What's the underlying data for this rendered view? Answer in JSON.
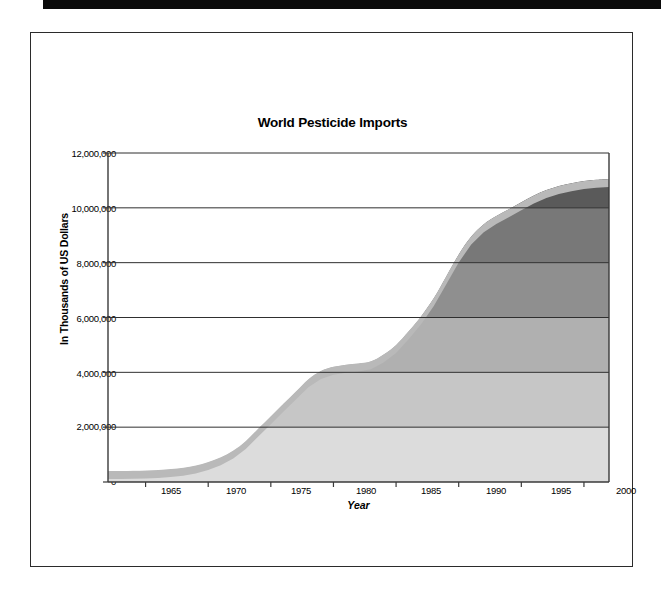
{
  "page": {
    "top_bar_name": "black-header-band",
    "frame_name": "document-page-frame"
  },
  "chart_data": {
    "type": "area",
    "title": "World Pesticide Imports",
    "xlabel": "Year",
    "ylabel": "In Thousands of US Dollars",
    "xlim": [
      1962,
      2002
    ],
    "ylim": [
      0,
      12000000
    ],
    "grid": true,
    "legend": "none",
    "ytick_labels": [
      "12,000,000",
      "10,000,000",
      "8,000,000",
      "6,000,000",
      "4,000,000",
      "2,000,000",
      "0"
    ],
    "ytick_values": [
      12000000,
      10000000,
      8000000,
      6000000,
      4000000,
      2000000,
      0
    ],
    "xtick_labels": [
      "1965",
      "1970",
      "1975",
      "1980",
      "1985",
      "1990",
      "1995",
      "2000"
    ],
    "xtick_values": [
      1965,
      1970,
      1975,
      1980,
      1985,
      1990,
      1995,
      2000
    ],
    "x": [
      1962,
      1963,
      1964,
      1965,
      1966,
      1967,
      1968,
      1969,
      1970,
      1971,
      1972,
      1973,
      1974,
      1975,
      1976,
      1977,
      1978,
      1979,
      1980,
      1981,
      1982,
      1983,
      1984,
      1985,
      1986,
      1987,
      1988,
      1989,
      1990,
      1991,
      1992,
      1993,
      1994,
      1995,
      1996,
      1997,
      1998,
      1999,
      2000,
      2001,
      2002
    ],
    "values": [
      400000,
      400000,
      410000,
      420000,
      440000,
      470000,
      520000,
      600000,
      730000,
      900000,
      1150000,
      1500000,
      1950000,
      2400000,
      2850000,
      3300000,
      3750000,
      4050000,
      4200000,
      4280000,
      4320000,
      4400000,
      4650000,
      5000000,
      5500000,
      6050000,
      6700000,
      7500000,
      8300000,
      8950000,
      9400000,
      9700000,
      9950000,
      10200000,
      10450000,
      10650000,
      10800000,
      10900000,
      10980000,
      11020000,
      11050000
    ],
    "band_colors": [
      "#dcdcdc",
      "#c6c6c6",
      "#b0b0b0",
      "#8f8f8f",
      "#787878",
      "#5a5a5a"
    ],
    "band_edge_color": "#b9b9b9",
    "gridline_color": "#2f2f2f",
    "axis_color": "#3a3a3a"
  },
  "marks": {
    "stray_mark": "·"
  }
}
